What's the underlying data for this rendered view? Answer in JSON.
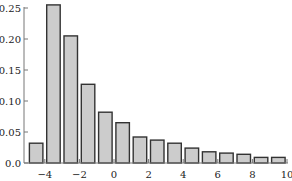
{
  "chart_data": {
    "type": "bar",
    "title": "",
    "xlabel": "",
    "ylabel": "",
    "x": [
      -4.5,
      -3.5,
      -2.5,
      -1.5,
      -0.5,
      0.5,
      1.5,
      2.5,
      3.5,
      4.5,
      5.5,
      6.5,
      7.5,
      8.5,
      9.5
    ],
    "values": [
      0.032,
      0.255,
      0.205,
      0.127,
      0.082,
      0.065,
      0.042,
      0.037,
      0.032,
      0.024,
      0.018,
      0.016,
      0.014,
      0.009,
      0.009
    ],
    "bar_width": 0.78,
    "xlim": [
      -5.3,
      10
    ],
    "ylim": [
      0,
      0.25
    ],
    "xticks": [
      -4,
      -2,
      0,
      2,
      4,
      6,
      8,
      10
    ],
    "xtick_labels": [
      "−4",
      "−2",
      "0",
      "2",
      "4",
      "6",
      "8",
      "10"
    ],
    "yticks": [
      0.0,
      0.05,
      0.1,
      0.15,
      0.2,
      0.25
    ],
    "ytick_labels": [
      "0.0",
      "0.05",
      "0.10",
      "0.15",
      "0.20",
      "0.25"
    ],
    "grid": false,
    "legend": null,
    "colors": {
      "bar_fill": "#cccccc",
      "bar_edge": "#333333",
      "axis": "#777777"
    }
  }
}
